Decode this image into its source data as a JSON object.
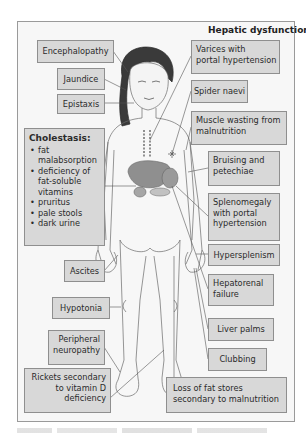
{
  "diagram": {
    "title": "Hepatic dysfunction",
    "left_labels": {
      "encephalopathy": "Encephalopathy",
      "jaundice": "Jaundice",
      "epistaxis": "Epistaxis",
      "ascites": "Ascites",
      "hypotonia": "Hypotonia",
      "peripheral_neuropathy": [
        "Peripheral",
        "neuropathy"
      ],
      "rickets": [
        "Rickets secondary",
        "to vitamin D",
        "deficiency"
      ]
    },
    "cholestasis": {
      "heading": "Cholestasis:",
      "items": [
        [
          "fat",
          "malabsorption"
        ],
        [
          "deficiency of",
          "fat-soluble",
          "vitamins"
        ],
        [
          "pruritus"
        ],
        [
          "pale stools"
        ],
        [
          "dark urine"
        ]
      ]
    },
    "right_labels": {
      "varices": [
        "Varices with",
        "portal hypertension"
      ],
      "spider_naevi": "Spider naevi",
      "muscle_wasting": [
        "Muscle wasting from",
        "malnutrition"
      ],
      "bruising": [
        "Bruising and",
        "petechiae"
      ],
      "splenomegaly": [
        "Splenomegaly",
        "with portal",
        "hypertension"
      ],
      "hypersplenism": "Hypersplenism",
      "hepatorenal": [
        "Hepatorenal",
        "failure"
      ],
      "liver_palms": "Liver palms",
      "clubbing": "Clubbing",
      "loss_of_fat": [
        "Loss of fat stores",
        "secondary to malnutrition"
      ]
    },
    "colors": {
      "box_fill": "#d8d8d8",
      "box_border": "#8f8f8f",
      "frame_bg": "#f7f7f7",
      "line": "#555555",
      "liver": "#8a8a8a"
    }
  }
}
